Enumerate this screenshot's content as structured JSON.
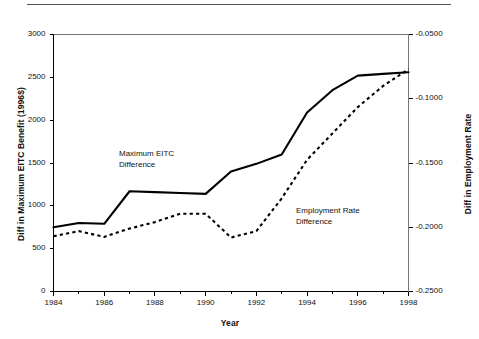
{
  "chart_data": {
    "type": "line",
    "title": "",
    "xlabel": "Year",
    "ylabel": "Diff in Maximum EITC Benefit (1996$)",
    "ylabel_right": "Diff in Employment Rate",
    "x": [
      1984,
      1985,
      1986,
      1987,
      1988,
      1989,
      1990,
      1991,
      1992,
      1993,
      1994,
      1995,
      1996,
      1997,
      1998
    ],
    "xlim": [
      1984,
      1998
    ],
    "ylim": [
      0,
      3000
    ],
    "ylim_right": [
      -0.25,
      -0.05
    ],
    "xticks": [
      "1984",
      "1986",
      "1988",
      "1990",
      "1992",
      "1994",
      "1996",
      "1998"
    ],
    "xtick_values": [
      1984,
      1986,
      1988,
      1990,
      1992,
      1994,
      1996,
      1998
    ],
    "xminor_values": [
      1985,
      1987,
      1989,
      1991,
      1993,
      1995,
      1997
    ],
    "yticks": [
      "0",
      "500",
      "1000",
      "1500",
      "2000",
      "2500",
      "3000"
    ],
    "ytick_values": [
      0,
      500,
      1000,
      1500,
      2000,
      2500,
      3000
    ],
    "yticks_right": [
      "-0.2500",
      "-0.2000",
      "-0.1500",
      "-0.1000",
      "-0.0500"
    ],
    "ytick_right_values": [
      -0.25,
      -0.2,
      -0.15,
      -0.1,
      -0.05
    ],
    "grid": false,
    "legend_position": "inline-annotations",
    "series": [
      {
        "name": "Maximum EITC Difference",
        "style": "solid",
        "axis": "left",
        "color": "#000000",
        "values": [
          750,
          800,
          790,
          1170,
          1160,
          1150,
          1140,
          1400,
          1490,
          1600,
          2090,
          2350,
          2520,
          2540,
          2560
        ]
      },
      {
        "name": "Employment Rate Difference",
        "style": "dashed",
        "axis": "right",
        "color": "#000000",
        "values": [
          -0.207,
          -0.203,
          -0.2075,
          -0.201,
          -0.196,
          -0.1895,
          -0.1895,
          -0.208,
          -0.203,
          -0.1775,
          -0.1475,
          -0.127,
          -0.1065,
          -0.09,
          -0.077
        ]
      }
    ],
    "annotations": [
      {
        "name": "maximum-eitc-difference",
        "text": "Maximum EITC\nDifference"
      },
      {
        "name": "employment-rate-difference",
        "text": "Employment Rate\nDifference"
      }
    ]
  }
}
